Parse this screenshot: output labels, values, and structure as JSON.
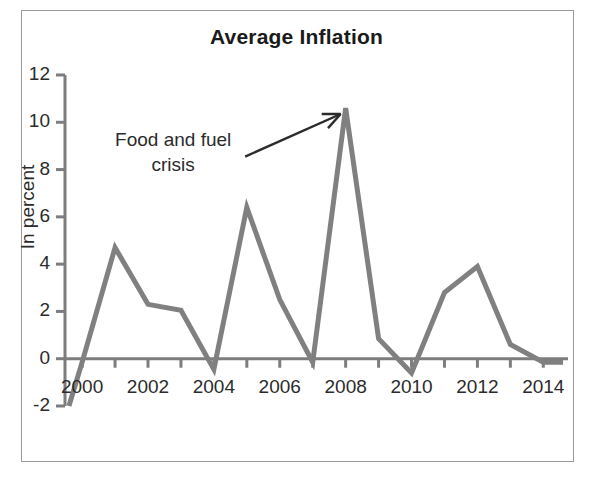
{
  "figure": {
    "border_color": "#9a9a9a",
    "background": "#ffffff"
  },
  "chart_data": {
    "type": "line",
    "title": "Average Inflation",
    "xlabel": "",
    "ylabel": "In percent",
    "x": [
      1999.6,
      2000,
      2001,
      2002,
      2003,
      2004,
      2005,
      2006,
      2007,
      2008,
      2009,
      2010,
      2011,
      2012,
      2013,
      2014,
      2014.6
    ],
    "values": [
      -2,
      -0.15,
      4.7,
      2.3,
      2.05,
      -0.45,
      6.4,
      2.5,
      -0.15,
      10.6,
      0.85,
      -0.6,
      2.8,
      3.9,
      0.6,
      -0.15,
      -0.15
    ],
    "series": [
      {
        "name": "Average Inflation",
        "color": "#808080",
        "line_width": 5,
        "values": [
          -2,
          -0.15,
          4.7,
          2.3,
          2.05,
          -0.45,
          6.4,
          2.5,
          -0.15,
          10.6,
          0.85,
          -0.6,
          2.8,
          3.9,
          0.6,
          -0.15,
          -0.15
        ]
      }
    ],
    "xlim": [
      1999.45,
      2014.75
    ],
    "ylim": [
      -2,
      12
    ],
    "ytick_values": [
      12,
      10,
      8,
      6,
      4,
      2,
      0,
      -2
    ],
    "ytick_labels": [
      "12",
      "10",
      "8",
      "6",
      "4",
      "2",
      "0",
      "-2"
    ],
    "xtick_major_values": [
      2000,
      2002,
      2004,
      2006,
      2008,
      2010,
      2012,
      2014
    ],
    "xtick_major_labels": [
      "2000",
      "2002",
      "2004",
      "2006",
      "2008",
      "2010",
      "2012",
      "2014"
    ],
    "xtick_minor_values": [
      2001,
      2003,
      2005,
      2007,
      2009,
      2011,
      2013
    ],
    "grid": false,
    "legend": "none",
    "annotations": [
      {
        "text_line_1": "Food and fuel",
        "text_line_2": "crisis",
        "arrow_from_x": 2004.95,
        "arrow_from_y": 8.55,
        "arrow_to_x": 2007.85,
        "arrow_to_y": 10.35,
        "color": "#2b2b2b"
      }
    ]
  }
}
